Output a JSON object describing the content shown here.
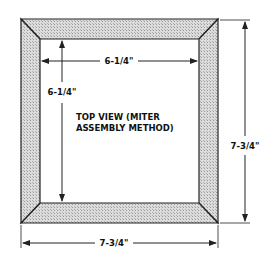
{
  "diagram": {
    "title_line1": "TOP VIEW (MITER",
    "title_line2": "ASSEMBLY METHOD)",
    "dimensions": {
      "inner_width": "6-1/4\"",
      "inner_height": "6-1/4\"",
      "outer_width": "7-3/4\"",
      "outer_height": "7-3/4\""
    },
    "colors": {
      "frame_fill": "#d4d4d4",
      "line": "#222222"
    }
  }
}
